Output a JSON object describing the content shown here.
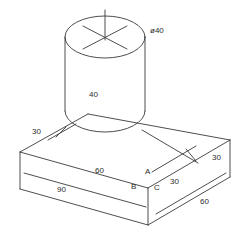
{
  "drawing": {
    "title": "isometric-part-drawing",
    "line_color": "#3a3a3a",
    "text_color": "#2b2b2b",
    "background": "#ffffff",
    "dimensions": [
      {
        "id": "diameter",
        "text": "ø40",
        "x": 150,
        "y": 27
      },
      {
        "id": "cylinder-height",
        "text": "40",
        "x": 89,
        "y": 91
      },
      {
        "id": "back-left-depth",
        "text": "30",
        "x": 32,
        "y": 128
      },
      {
        "id": "top-length-60",
        "text": "60",
        "x": 95,
        "y": 167
      },
      {
        "id": "bottom-length-90",
        "text": "90",
        "x": 57,
        "y": 186
      },
      {
        "id": "right-thickness-30",
        "text": "30",
        "x": 212,
        "y": 154
      },
      {
        "id": "front-offset-30",
        "text": "30",
        "x": 170,
        "y": 178
      },
      {
        "id": "front-width-60",
        "text": "60",
        "x": 200,
        "y": 198
      }
    ],
    "vertex_labels": [
      {
        "id": "vertex-a",
        "text": "A",
        "x": 145,
        "y": 168
      },
      {
        "id": "vertex-b",
        "text": "B",
        "x": 131,
        "y": 183
      },
      {
        "id": "vertex-c",
        "text": "C",
        "x": 154,
        "y": 184
      }
    ]
  }
}
